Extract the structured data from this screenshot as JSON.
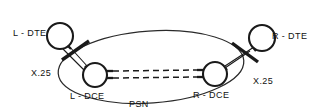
{
  "diagram": {
    "type": "network-topology",
    "cloud": {
      "name": "PSN",
      "label": "PSN",
      "description": "Packet Switched Network cloud"
    },
    "nodes": [
      {
        "id": "l-dte",
        "label": "L - DTE",
        "role": "DTE",
        "side": "left",
        "inside_cloud": false,
        "cx": 60,
        "cy": 36,
        "r": 13
      },
      {
        "id": "r-dte",
        "label": "R - DTE",
        "role": "DTE",
        "side": "right",
        "inside_cloud": false,
        "cx": 262,
        "cy": 38,
        "r": 13
      },
      {
        "id": "l-dce",
        "label": "L - DCE",
        "role": "DCE",
        "side": "left",
        "inside_cloud": true,
        "cx": 95,
        "cy": 75,
        "r": 12
      },
      {
        "id": "r-dce",
        "label": "R - DCE",
        "role": "DCE",
        "side": "right",
        "inside_cloud": true,
        "cx": 215,
        "cy": 74,
        "r": 12
      }
    ],
    "links": [
      {
        "id": "left-access",
        "from": "l-dte",
        "to": "l-dce",
        "style": "double-solid",
        "protocol_label": "X.25",
        "has_slash_marker": true
      },
      {
        "id": "right-access",
        "from": "r-dte",
        "to": "r-dce",
        "style": "double-solid",
        "protocol_label": "X.25",
        "has_slash_marker": true
      },
      {
        "id": "virtual-circuits",
        "from": "l-dce",
        "to": "r-dce",
        "style": "double-dashed",
        "protocol_label": "",
        "has_slash_marker": false
      }
    ],
    "labels": {
      "l_dte": "L - DTE",
      "r_dte": "R - DTE",
      "l_dce": "L - DCE",
      "r_dce": "R - DCE",
      "x25_left": "X.25",
      "x25_right": "X.25",
      "psn": "PSN"
    },
    "colors": {
      "stroke": "#1a1a1a",
      "cloud_stroke": "#2a2a2a",
      "background": "#ffffff",
      "text": "#111111"
    }
  }
}
